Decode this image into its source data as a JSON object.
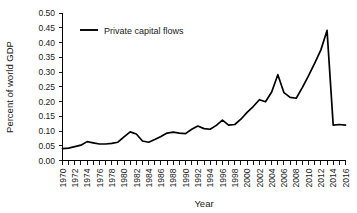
{
  "chart_data": {
    "type": "line",
    "title": "",
    "xlabel": "Year",
    "ylabel": "Percent of world GDP",
    "xlim": [
      1970,
      2016
    ],
    "ylim": [
      0.0,
      0.5
    ],
    "grid": false,
    "legend_position": "top-left",
    "y_ticks": [
      "0.00",
      "0.05",
      "0.10",
      "0.15",
      "0.20",
      "0.25",
      "0.30",
      "0.35",
      "0.40",
      "0.45",
      "0.50"
    ],
    "y_tick_values": [
      0.0,
      0.05,
      0.1,
      0.15,
      0.2,
      0.25,
      0.3,
      0.35,
      0.4,
      0.45,
      0.5
    ],
    "x_tick_labels": [
      "1970",
      "1972",
      "1974",
      "1976",
      "1978",
      "1980",
      "1982",
      "1984",
      "1986",
      "1988",
      "1990",
      "1992",
      "1994",
      "1996",
      "1998",
      "2000",
      "2002",
      "2004",
      "2006",
      "2008",
      "2010",
      "2012",
      "2014",
      "2016"
    ],
    "x_minor_tick_interval": 1,
    "x": [
      1970,
      1971,
      1972,
      1973,
      1974,
      1975,
      1976,
      1977,
      1978,
      1979,
      1980,
      1981,
      1982,
      1983,
      1984,
      1985,
      1986,
      1987,
      1988,
      1989,
      1990,
      1991,
      1992,
      1993,
      1994,
      1995,
      1996,
      1997,
      1998,
      1999,
      2000,
      2001,
      2002,
      2003,
      2004,
      2005,
      2006,
      2007,
      2008,
      2009,
      2010,
      2011,
      2012,
      2013,
      2014,
      2015,
      2016
    ],
    "series": [
      {
        "name": "Private capital flows",
        "color": "#000000",
        "values": [
          0.04,
          0.042,
          0.047,
          0.052,
          0.064,
          0.06,
          0.056,
          0.056,
          0.058,
          0.062,
          0.08,
          0.097,
          0.09,
          0.066,
          0.062,
          0.071,
          0.081,
          0.093,
          0.096,
          0.093,
          0.091,
          0.106,
          0.117,
          0.108,
          0.106,
          0.119,
          0.137,
          0.12,
          0.122,
          0.14,
          0.163,
          0.183,
          0.206,
          0.199,
          0.232,
          0.291,
          0.23,
          0.214,
          0.211,
          0.248,
          0.288,
          0.33,
          0.375,
          0.441,
          0.12,
          0.122,
          0.12
        ]
      }
    ],
    "note_series_alignment": "values are aligned to x year-by-year; the sharp 2007 peak of 0.441 drops to 0.120 in 2008"
  },
  "legend": {
    "entries": [
      {
        "label": "Private capital flows",
        "color": "#000000"
      }
    ]
  },
  "axes": {
    "x_axis_title": "Year",
    "y_axis_title": "Percent of world GDP"
  }
}
